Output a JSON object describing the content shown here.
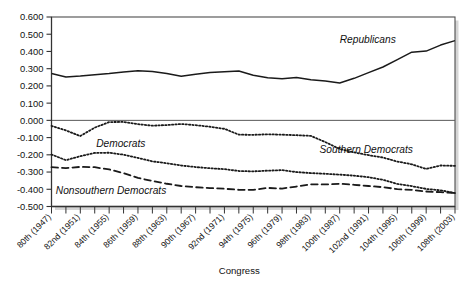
{
  "figure": {
    "background_color": "#ffffff",
    "line_color": "#1a1a1a",
    "frame_color": "#4d4d4d",
    "shadow_color": "#b3b3b3"
  },
  "axes": {
    "x_title": "Congress",
    "y_title": ""
  },
  "chart_data": {
    "type": "line",
    "title": "",
    "subtitle": "",
    "xlabel": "Congress",
    "ylabel": "",
    "xlim": [
      0,
      28
    ],
    "ylim": [
      -0.5,
      0.6
    ],
    "grid": false,
    "legend_position": "inline-annotations",
    "ytick_labels": [
      "0.600",
      "0.500",
      "0.400",
      "0.300",
      "0.200",
      "0.100",
      "0.000",
      "-0.100",
      "-0.200",
      "-0.300",
      "-0.400",
      "-0.500"
    ],
    "ytick_values": [
      0.6,
      0.5,
      0.4,
      0.3,
      0.2,
      0.1,
      0.0,
      -0.1,
      -0.2,
      -0.3,
      -0.4,
      -0.5
    ],
    "x_categories": [
      "80th (1947)",
      "81st (1949)",
      "82nd (1951)",
      "83rd (1953)",
      "84th (1955)",
      "85th (1957)",
      "86th (1959)",
      "87th (1961)",
      "88th (1963)",
      "89th (1965)",
      "90th (1967)",
      "91st (1969)",
      "92nd (1971)",
      "93rd (1973)",
      "94th (1975)",
      "95th (1977)",
      "96th (1979)",
      "97th (1981)",
      "98th (1983)",
      "99th (1985)",
      "100th (1987)",
      "101st (1989)",
      "102nd (1991)",
      "103rd (1993)",
      "104th (1995)",
      "105th (1997)",
      "106th (1999)",
      "107th (2001)",
      "108th (2003)"
    ],
    "xtick_labels_shown": [
      "80th (1947)",
      "82nd (1951)",
      "84th (1955)",
      "86th (1959)",
      "88th (1963)",
      "90th (1967)",
      "92nd (1971)",
      "94th (1975)",
      "96th (1979)",
      "98th (1983)",
      "100th (1987)",
      "102nd (1991)",
      "104th (1995)",
      "106th (1999)",
      "108th (2003)"
    ],
    "series": [
      {
        "name": "Republicans",
        "label": "Republicans",
        "style": "solid",
        "values": [
          0.272,
          0.252,
          0.257,
          0.265,
          0.272,
          0.281,
          0.288,
          0.284,
          0.272,
          0.256,
          0.268,
          0.278,
          0.282,
          0.287,
          0.262,
          0.248,
          0.242,
          0.249,
          0.236,
          0.228,
          0.217,
          0.244,
          0.277,
          0.31,
          0.353,
          0.396,
          0.402,
          0.437,
          0.463
        ]
      },
      {
        "name": "Southern Democrats",
        "label": "Southern Democrats",
        "style": "dotted",
        "values": [
          -0.032,
          -0.058,
          -0.091,
          -0.042,
          -0.01,
          -0.009,
          -0.022,
          -0.031,
          -0.027,
          -0.021,
          -0.028,
          -0.037,
          -0.049,
          -0.083,
          -0.084,
          -0.081,
          -0.083,
          -0.086,
          -0.09,
          -0.126,
          -0.166,
          -0.186,
          -0.202,
          -0.216,
          -0.239,
          -0.255,
          -0.282,
          -0.262,
          -0.264
        ]
      },
      {
        "name": "Democrats",
        "label": "Democrats",
        "style": "dotted",
        "values": [
          -0.198,
          -0.231,
          -0.208,
          -0.189,
          -0.188,
          -0.199,
          -0.218,
          -0.238,
          -0.249,
          -0.262,
          -0.271,
          -0.278,
          -0.283,
          -0.294,
          -0.296,
          -0.292,
          -0.289,
          -0.3,
          -0.306,
          -0.31,
          -0.315,
          -0.321,
          -0.33,
          -0.345,
          -0.369,
          -0.382,
          -0.398,
          -0.406,
          -0.422
        ]
      },
      {
        "name": "Nonsouthern Democrats",
        "label": "Nonsouthern Democrats",
        "style": "dashed",
        "values": [
          -0.272,
          -0.277,
          -0.27,
          -0.272,
          -0.285,
          -0.306,
          -0.334,
          -0.352,
          -0.368,
          -0.381,
          -0.388,
          -0.393,
          -0.397,
          -0.403,
          -0.403,
          -0.392,
          -0.396,
          -0.384,
          -0.371,
          -0.372,
          -0.368,
          -0.374,
          -0.381,
          -0.388,
          -0.399,
          -0.404,
          -0.413,
          -0.417,
          -0.421
        ]
      }
    ],
    "annotations": [
      {
        "text": "Republicans",
        "x": 20.0,
        "y": 0.452
      },
      {
        "text": "Southern Democrats",
        "x": 18.6,
        "y": -0.188
      },
      {
        "text": "Democrats",
        "x": 3.1,
        "y": -0.152
      },
      {
        "text": "Nonsouthern Democrats",
        "x": 0.3,
        "y": -0.428
      }
    ]
  },
  "caption": ""
}
